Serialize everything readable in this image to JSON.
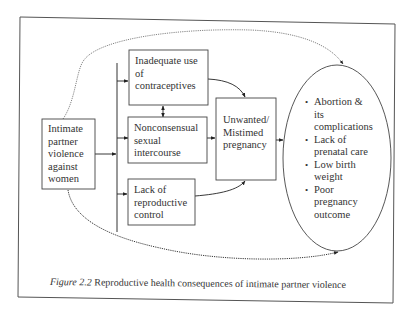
{
  "diagram": {
    "nodes": {
      "ipv": "Intimate partner violence against women",
      "ipv_lines": [
        "Intimate",
        "partner",
        "violence",
        "against",
        "women"
      ],
      "contraceptives_lines": [
        "Inadequate use",
        "of",
        "contraceptives"
      ],
      "nonconsensual_lines": [
        "Nonconsensual",
        "sexual",
        "intercourse"
      ],
      "reproductive_control_lines": [
        "Lack of",
        "reproductive",
        "control"
      ],
      "unwanted_lines": [
        "Unwanted/",
        "Mistimed",
        "pregnancy"
      ]
    },
    "outcomes": [
      {
        "lines": [
          "Abortion &",
          "its",
          "complications"
        ]
      },
      {
        "lines": [
          "Lack of",
          "prenatal care"
        ]
      },
      {
        "lines": [
          "Low birth",
          "weight"
        ]
      },
      {
        "lines": [
          "Poor",
          "pregnancy",
          "outcome"
        ]
      }
    ],
    "bullet_glyph": "•",
    "edges": [
      {
        "from": "ipv",
        "to": "mediator-bar",
        "style": "solid"
      },
      {
        "from": "mediator-bar",
        "to": "contraceptives",
        "style": "solid"
      },
      {
        "from": "mediator-bar",
        "to": "nonconsensual",
        "style": "solid"
      },
      {
        "from": "mediator-bar",
        "to": "reproductive_control",
        "style": "solid"
      },
      {
        "from": "contraceptives",
        "to": "nonconsensual",
        "style": "solid-bidirectional"
      },
      {
        "from": "contraceptives",
        "to": "unwanted",
        "style": "solid-curved"
      },
      {
        "from": "nonconsensual",
        "to": "unwanted",
        "style": "solid"
      },
      {
        "from": "reproductive_control",
        "to": "unwanted",
        "style": "solid-curved"
      },
      {
        "from": "unwanted",
        "to": "outcomes",
        "style": "solid"
      },
      {
        "from": "ipv",
        "to": "outcomes",
        "style": "dotted-curved-top"
      },
      {
        "from": "ipv",
        "to": "outcomes",
        "style": "dotted-curved-bottom"
      }
    ],
    "caption": {
      "label": "Figure 2.2",
      "text": " Reproductive health consequences of intimate partner violence"
    }
  }
}
